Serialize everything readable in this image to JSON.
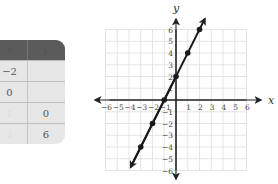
{
  "table": {
    "headers": [
      "x",
      "y"
    ],
    "rows": [
      {
        "x": "−2",
        "y": ""
      },
      {
        "x": "0",
        "y": ""
      },
      {
        "x": "1",
        "y": "0"
      },
      {
        "x": "2",
        "y": "6"
      }
    ],
    "header_color": "#5b5b5b",
    "body_color": "#e6e6e6"
  },
  "chart_data": {
    "type": "line",
    "title": "",
    "xlabel": "x",
    "ylabel": "y",
    "xlim": [
      -6,
      6
    ],
    "ylim": [
      -6,
      6
    ],
    "grid": true,
    "x_ticks": [
      "−6",
      "−5",
      "−4",
      "−3",
      "−2",
      "−1",
      "1",
      "2",
      "3",
      "4",
      "5",
      "6"
    ],
    "y_ticks": [
      "6",
      "5",
      "4",
      "3",
      "2",
      "1",
      "−1",
      "−2",
      "−3",
      "−4",
      "−5",
      "−6"
    ],
    "series": [
      {
        "name": "y = 2x + 2",
        "equation": "y = 2x + 2",
        "x": [
          -3,
          -2,
          -1,
          0,
          1,
          2
        ],
        "y": [
          -4,
          -2,
          0,
          2,
          4,
          6
        ],
        "line_color": "#1a1a1a",
        "extends_with_arrows": true
      }
    ]
  }
}
